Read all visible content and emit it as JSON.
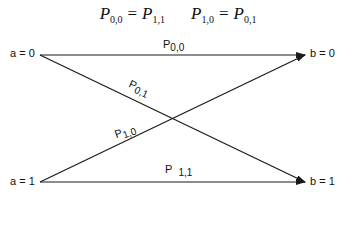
{
  "equations": [
    {
      "lhs": "P",
      "lhs_sub": "0,0",
      "op": "=",
      "rhs": "P",
      "rhs_sub": "1,1"
    },
    {
      "lhs": "P",
      "lhs_sub": "1,0",
      "op": "=",
      "rhs": "P",
      "rhs_sub": "0,1"
    }
  ],
  "nodes": {
    "a0": "a = 0",
    "a1": "a = 1",
    "b0": "b = 0",
    "b1": "b = 1"
  },
  "edges": {
    "p00": {
      "main": "P",
      "sub": "0,0"
    },
    "p01": {
      "main": "P",
      "sub": "0,1"
    },
    "p10": {
      "main": "P",
      "sub": "1,0"
    },
    "p11": {
      "main": "P",
      "sub": "1,1"
    }
  },
  "colors": {
    "line": "#1a1a1a",
    "text": "#111111",
    "background": "#ffffff"
  }
}
